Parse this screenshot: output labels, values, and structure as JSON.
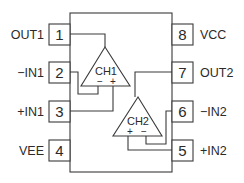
{
  "diagram": {
    "pins": [
      {
        "number": "1",
        "label": "OUT1",
        "side": "left"
      },
      {
        "number": "2",
        "label": "−IN1",
        "side": "left"
      },
      {
        "number": "3",
        "label": "+IN1",
        "side": "left"
      },
      {
        "number": "4",
        "label": "VEE",
        "side": "left"
      },
      {
        "number": "8",
        "label": "VCC",
        "side": "right"
      },
      {
        "number": "7",
        "label": "OUT2",
        "side": "right"
      },
      {
        "number": "6",
        "label": "−IN2",
        "side": "right"
      },
      {
        "number": "5",
        "label": "+IN2",
        "side": "right"
      }
    ],
    "amplifiers": [
      {
        "name": "CH1",
        "inv": "−",
        "noninv": "+"
      },
      {
        "name": "CH2",
        "inv": "−",
        "noninv": "+"
      }
    ]
  }
}
